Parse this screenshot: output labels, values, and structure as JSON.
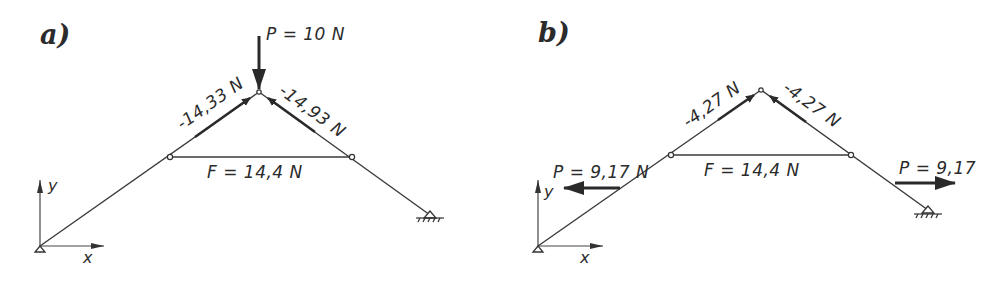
{
  "panels": [
    {
      "id": "a",
      "label": "a)",
      "load": "P = 10 N",
      "left_member_force": "-14,33 N",
      "right_member_force": "-14,93 N",
      "tie_force": "F = 14,4 N",
      "axis_x": "x",
      "axis_y": "y"
    },
    {
      "id": "b",
      "label": "b)",
      "left_load": "P = 9,17 N",
      "right_load": "P = 9,17",
      "left_member_force": "-4,27 N",
      "right_member_force": "-4,27 N",
      "tie_force": "F = 14,4 N",
      "axis_x": "x",
      "axis_y": "y"
    }
  ],
  "colors": {
    "line": "#3a3a3a",
    "text": "#2b2b2b",
    "background": "#ffffff"
  }
}
